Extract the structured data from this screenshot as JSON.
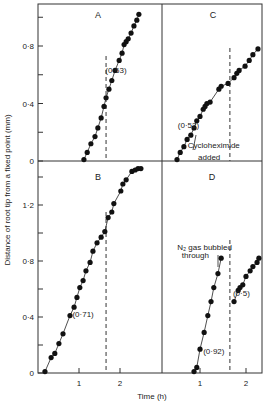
{
  "figure": {
    "ylabel": "Distance of root tip from a fixed point (mm)",
    "xlabel": "Time (h)"
  },
  "chart_data": [
    {
      "type": "scatter",
      "panel": "A",
      "title": "A",
      "xlabel": "Time (h)",
      "ylabel": "Distance of root tip from a fixed point (mm)",
      "xticks": [
        1,
        2
      ],
      "yticks": [
        0,
        0.4,
        0.8
      ],
      "ytick_labels": [
        "0",
        "0·4",
        "0·8"
      ],
      "ylim": [
        0,
        1.09
      ],
      "dashed_line_x": 1.66,
      "annotations": [
        {
          "text": "(0·63)",
          "x": 1.9,
          "y": 0.63
        }
      ],
      "points": [
        [
          1.12,
          0.01
        ],
        [
          1.2,
          0.06
        ],
        [
          1.29,
          0.12
        ],
        [
          1.39,
          0.17
        ],
        [
          1.46,
          0.23
        ],
        [
          1.54,
          0.3
        ],
        [
          1.61,
          0.38
        ],
        [
          1.66,
          0.44
        ],
        [
          1.73,
          0.5
        ],
        [
          1.8,
          0.56
        ],
        [
          1.88,
          0.63
        ],
        [
          1.98,
          0.7
        ],
        [
          2.05,
          0.75
        ],
        [
          2.1,
          0.81
        ],
        [
          2.15,
          0.83
        ],
        [
          2.2,
          0.85
        ],
        [
          2.27,
          0.89
        ],
        [
          2.34,
          0.94
        ],
        [
          2.41,
          0.98
        ],
        [
          2.46,
          1.02
        ]
      ]
    },
    {
      "type": "scatter",
      "panel": "B",
      "title": "B",
      "xticks": [
        1,
        2
      ],
      "yticks": [
        0,
        0.4,
        0.8,
        1.2
      ],
      "ytick_labels": [
        "0",
        "0·4",
        "0·8",
        "1·2"
      ],
      "ylim": [
        0,
        1.5
      ],
      "dashed_line_x": 1.66,
      "annotations": [
        {
          "text": "(0·71)",
          "x": 1.1,
          "y": 0.42
        }
      ],
      "points": [
        [
          0.17,
          0.01
        ],
        [
          0.32,
          0.11
        ],
        [
          0.41,
          0.14
        ],
        [
          0.51,
          0.21
        ],
        [
          0.61,
          0.28
        ],
        [
          0.78,
          0.41
        ],
        [
          0.88,
          0.47
        ],
        [
          0.95,
          0.54
        ],
        [
          1.02,
          0.61
        ],
        [
          1.1,
          0.66
        ],
        [
          1.17,
          0.73
        ],
        [
          1.27,
          0.79
        ],
        [
          1.34,
          0.87
        ],
        [
          1.44,
          0.93
        ],
        [
          1.54,
          0.97
        ],
        [
          1.63,
          1.01
        ],
        [
          1.71,
          1.11
        ],
        [
          1.8,
          1.15
        ],
        [
          1.85,
          1.21
        ],
        [
          2.02,
          1.3
        ],
        [
          2.07,
          1.35
        ],
        [
          2.15,
          1.38
        ],
        [
          2.29,
          1.44
        ],
        [
          2.37,
          1.45
        ],
        [
          2.44,
          1.46
        ],
        [
          2.51,
          1.46
        ]
      ]
    },
    {
      "type": "scatter",
      "panel": "C",
      "title": "C",
      "xticks": [
        1,
        2
      ],
      "ylim": [
        0,
        1.09
      ],
      "dashed_line_x": 1.65,
      "annotations": [
        {
          "text": "(0·52)",
          "x": 0.75,
          "y": 0.25
        },
        {
          "text": "Cycloheximide",
          "x": 1.3,
          "y": 0.11
        },
        {
          "text": "added",
          "x": 1.2,
          "y": 0.03
        }
      ],
      "points": [
        [
          0.5,
          0.01
        ],
        [
          0.57,
          0.06
        ],
        [
          0.65,
          0.1
        ],
        [
          0.72,
          0.15
        ],
        [
          0.8,
          0.18
        ],
        [
          0.87,
          0.23
        ],
        [
          0.93,
          0.28
        ],
        [
          1.0,
          0.31
        ],
        [
          1.07,
          0.36
        ],
        [
          1.11,
          0.38
        ],
        [
          1.15,
          0.4
        ],
        [
          1.22,
          0.41
        ],
        [
          1.41,
          0.5
        ],
        [
          1.46,
          0.52
        ],
        [
          1.61,
          0.54
        ],
        [
          1.74,
          0.58
        ],
        [
          1.8,
          0.61
        ],
        [
          1.85,
          0.63
        ],
        [
          1.98,
          0.66
        ],
        [
          2.07,
          0.7
        ],
        [
          2.15,
          0.74
        ],
        [
          2.26,
          0.78
        ]
      ]
    },
    {
      "type": "scatter",
      "panel": "D",
      "title": "D",
      "xticks": [
        1,
        2
      ],
      "ylim": [
        0,
        1.5
      ],
      "dashed_line_x": 1.65,
      "annotations": [
        {
          "text": "N₂ gas bubbled",
          "x": 1.1,
          "y": 0.9
        },
        {
          "text": "through",
          "x": 0.9,
          "y": 0.84
        },
        {
          "text": "(0·92)",
          "x": 1.3,
          "y": 0.16
        },
        {
          "text": "(0·5)",
          "x": 1.9,
          "y": 0.57
        }
      ],
      "points": [
        [
          0.87,
          0.01
        ],
        [
          0.93,
          0.04
        ],
        [
          1.0,
          0.17
        ],
        [
          1.09,
          0.29
        ],
        [
          1.17,
          0.41
        ],
        [
          1.24,
          0.51
        ],
        [
          1.3,
          0.61
        ],
        [
          1.39,
          0.71
        ],
        [
          1.46,
          0.82
        ],
        [
          1.74,
          0.51
        ],
        [
          1.83,
          0.59
        ],
        [
          1.87,
          0.61
        ],
        [
          1.93,
          0.63
        ],
        [
          2.0,
          0.69
        ],
        [
          2.09,
          0.73
        ],
        [
          2.15,
          0.76
        ],
        [
          2.24,
          0.79
        ],
        [
          2.28,
          0.82
        ]
      ]
    }
  ]
}
